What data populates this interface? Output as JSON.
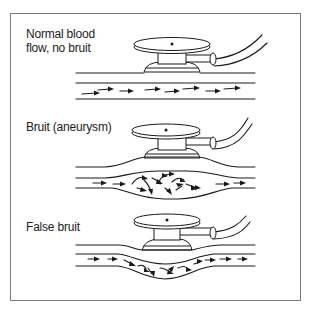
{
  "figure": {
    "panels": [
      {
        "id": "normal",
        "label": "Normal blood\nflow, no bruit",
        "vessel_shape": "straight",
        "flow": "laminar"
      },
      {
        "id": "aneurysm",
        "label": "Bruit (aneurysm)",
        "vessel_shape": "dilated",
        "flow": "turbulent"
      },
      {
        "id": "false",
        "label": "False bruit",
        "vessel_shape": "compressed by stethoscope",
        "flow": "turbulent"
      }
    ],
    "icons": [
      "stethoscope-icon",
      "blood-vessel-icon",
      "flow-arrow-icon"
    ],
    "colors": {
      "line": "#1a1a1a",
      "frame": "#7a7a7a",
      "background": "#ffffff"
    }
  }
}
